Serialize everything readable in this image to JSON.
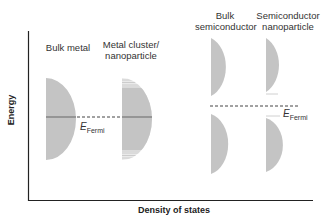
{
  "diagram": {
    "axes": {
      "x_label": "Density of states",
      "y_label": "Energy"
    },
    "columns": [
      {
        "label": "Bulk metal"
      },
      {
        "label_line1": "Metal cluster/",
        "label_line2": "nanoparticle"
      },
      {
        "label_line1": "Bulk",
        "label_line2": "semiconductor"
      },
      {
        "label_line1": "Semiconductor",
        "label_line2": "nanoparticle"
      }
    ],
    "fermi_label_main": "E",
    "fermi_label_sub": "Fermi",
    "colors": {
      "fill": "#c4c4c4",
      "fermi_line": "#8a8a8a",
      "axis": "#222222",
      "dash": "#444444"
    }
  }
}
